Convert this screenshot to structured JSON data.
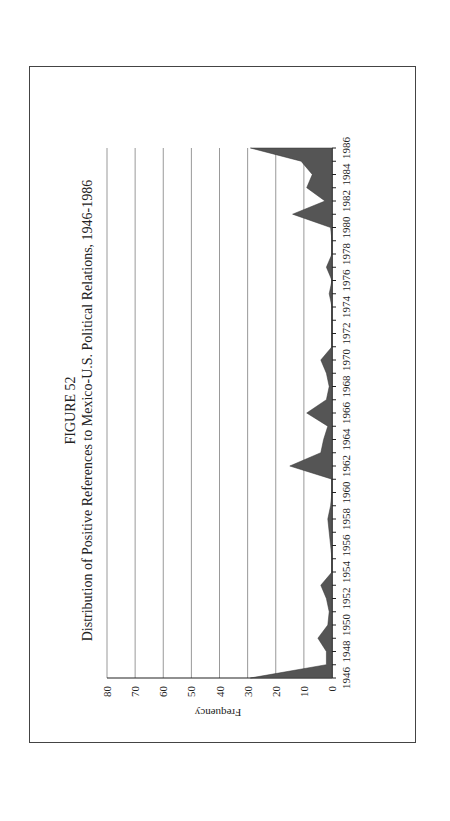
{
  "figure": {
    "label": "FIGURE 52",
    "title": "Distribution of Positive References to Mexico-U.S. Political Relations, 1946-1986",
    "ylabel": "Frequency",
    "fill_color": "#555555",
    "grid_color": "#999999"
  },
  "chart_data": {
    "type": "area",
    "xlabel": "",
    "ylabel": "Frequency",
    "ylim": [
      0,
      80
    ],
    "yticks": [
      0,
      10,
      20,
      30,
      40,
      50,
      60,
      70,
      80
    ],
    "xtick_labels": [
      "1946",
      "1948",
      "1950",
      "1952",
      "1954",
      "1956",
      "1958",
      "1960",
      "1962",
      "1964",
      "1966",
      "1968",
      "1970",
      "1972",
      "1974",
      "1976",
      "1978",
      "1980",
      "1982",
      "1984",
      "1986"
    ],
    "grid": "horizontal",
    "orientation": "rotated 90 degrees counter-clockwise on page",
    "x": [
      1946,
      1947,
      1948,
      1949,
      1950,
      1951,
      1952,
      1953,
      1954,
      1955,
      1956,
      1957,
      1958,
      1959,
      1960,
      1961,
      1962,
      1963,
      1964,
      1965,
      1966,
      1967,
      1968,
      1969,
      1970,
      1971,
      1972,
      1973,
      1974,
      1975,
      1976,
      1977,
      1978,
      1979,
      1980,
      1981,
      1982,
      1983,
      1984,
      1985,
      1986
    ],
    "values": [
      29,
      2,
      2,
      5,
      1.5,
      1,
      2,
      4,
      0,
      0,
      0.5,
      1,
      1.5,
      0.5,
      0,
      0,
      15,
      4,
      3,
      1.5,
      9,
      2,
      1,
      2,
      4,
      0,
      0,
      0,
      0,
      1,
      0,
      2,
      0,
      0,
      0.5,
      14,
      2.5,
      9,
      7,
      11,
      29
    ]
  }
}
